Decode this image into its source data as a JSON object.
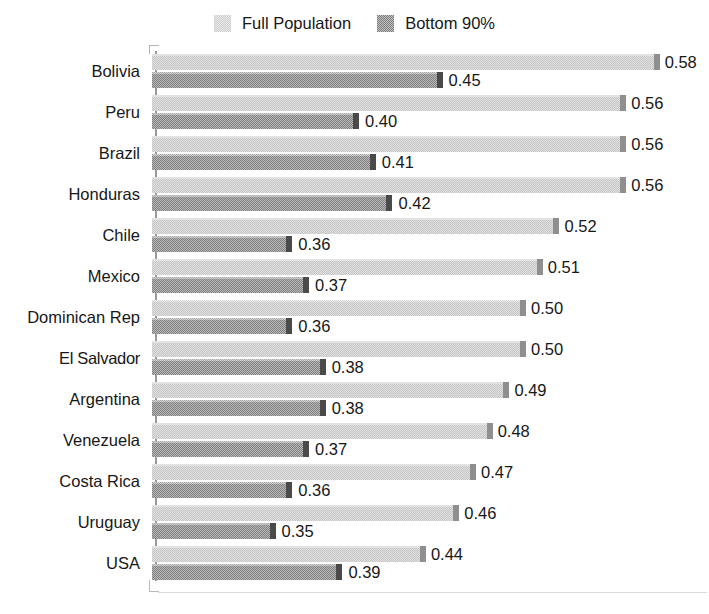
{
  "legend": {
    "position": "top-center",
    "entries": [
      {
        "label": "Full Population",
        "color": "#c6c6c6",
        "swatch": "full"
      },
      {
        "label": "Bottom 90%",
        "color": "#808080",
        "swatch": "bottom"
      }
    ]
  },
  "axis": {
    "grid": false,
    "value_format": "0.00",
    "orientation": "horizontal-bars"
  },
  "chart_data": {
    "type": "bar",
    "title": "",
    "subtitle": "",
    "xlabel": "",
    "ylabel": "",
    "orientation": "horizontal",
    "grid": false,
    "legend_position": "top-center",
    "categories": [
      "Bolivia",
      "Peru",
      "Brazil",
      "Honduras",
      "Chile",
      "Mexico",
      "Dominican Rep",
      "El Salvador",
      "Argentina",
      "Venezuela",
      "Costa Rica",
      "Uruguay",
      "USA"
    ],
    "series": [
      {
        "name": "Full Population",
        "color": "#c6c6c6",
        "values": [
          0.58,
          0.56,
          0.56,
          0.56,
          0.52,
          0.51,
          0.5,
          0.5,
          0.49,
          0.48,
          0.47,
          0.46,
          0.44
        ],
        "labels": [
          "0.58",
          "0.56",
          "0.56",
          "0.56",
          "0.52",
          "0.51",
          "0.50",
          "0.50",
          "0.49",
          "0.48",
          "0.47",
          "0.46",
          "0.44"
        ]
      },
      {
        "name": "Bottom 90%",
        "color": "#808080",
        "values": [
          0.45,
          0.4,
          0.41,
          0.42,
          0.36,
          0.37,
          0.36,
          0.38,
          0.38,
          0.37,
          0.36,
          0.35,
          0.39
        ],
        "labels": [
          "0.45",
          "0.40",
          "0.41",
          "0.42",
          "0.36",
          "0.37",
          "0.36",
          "0.38",
          "0.38",
          "0.37",
          "0.36",
          "0.35",
          "0.39"
        ]
      }
    ],
    "xlim": [
      0.325,
      0.59
    ],
    "value_min": 0.35,
    "value_max": 0.58
  },
  "render": {
    "bar_px_per_unit": 1670,
    "bar_origin_value": 0.276,
    "row_top_first": 9,
    "row_pitch": 41.0,
    "bar_height": 16,
    "bar_gap": 2
  }
}
